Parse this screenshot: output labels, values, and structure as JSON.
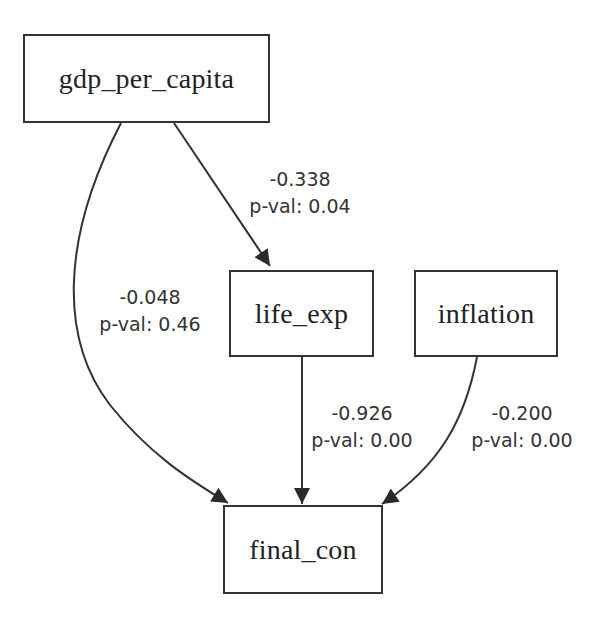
{
  "diagram": {
    "type": "path-diagram",
    "nodes": [
      {
        "id": "gdp_per_capita",
        "label": "gdp_per_capita"
      },
      {
        "id": "life_exp",
        "label": "life_exp"
      },
      {
        "id": "inflation",
        "label": "inflation"
      },
      {
        "id": "final_con",
        "label": "final_con"
      }
    ],
    "edges": [
      {
        "from": "gdp_per_capita",
        "to": "life_exp",
        "coef": "-0.338",
        "pval": "p-val: 0.04"
      },
      {
        "from": "gdp_per_capita",
        "to": "final_con",
        "coef": "-0.048",
        "pval": "p-val: 0.46"
      },
      {
        "from": "life_exp",
        "to": "final_con",
        "coef": "-0.926",
        "pval": "p-val: 0.00"
      },
      {
        "from": "inflation",
        "to": "final_con",
        "coef": "-0.200",
        "pval": "p-val: 0.00"
      }
    ],
    "colors": {
      "stroke": "#333333",
      "text": "#222222",
      "background": "#ffffff"
    }
  }
}
